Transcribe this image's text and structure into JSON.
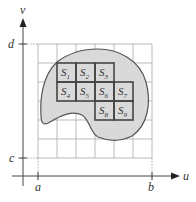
{
  "figure": {
    "axes": {
      "x_label": "u",
      "y_label": "v",
      "x_ticks": [
        {
          "label": "a",
          "x": 38
        },
        {
          "label": "b",
          "x": 152
        }
      ],
      "y_ticks": [
        {
          "label": "c",
          "y": 158
        },
        {
          "label": "d",
          "y": 44
        }
      ]
    },
    "grid": {
      "x0": 38,
      "y0": 44,
      "cols": 6,
      "rows": 6,
      "cell": 19
    },
    "region": {
      "fill": "#d9d9d9",
      "stroke": "#555555"
    },
    "subrectangles": [
      {
        "label": "S",
        "sub": "1",
        "col": 1,
        "row": 1
      },
      {
        "label": "S",
        "sub": "2",
        "col": 2,
        "row": 1
      },
      {
        "label": "S",
        "sub": "3",
        "col": 3,
        "row": 1
      },
      {
        "label": "S",
        "sub": "4",
        "col": 1,
        "row": 2
      },
      {
        "label": "S",
        "sub": "5",
        "col": 2,
        "row": 2
      },
      {
        "label": "S",
        "sub": "6",
        "col": 3,
        "row": 2
      },
      {
        "label": "S",
        "sub": "7",
        "col": 4,
        "row": 2
      },
      {
        "label": "S",
        "sub": "8",
        "col": 3,
        "row": 3
      },
      {
        "label": "S",
        "sub": "9",
        "col": 4,
        "row": 3
      }
    ],
    "colors": {
      "grid": "#aaaaaa",
      "axis": "#444444",
      "sub_border": "#444444"
    }
  }
}
